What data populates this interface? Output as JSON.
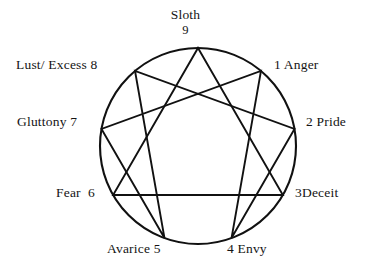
{
  "diagram": {
    "type": "enneagram",
    "geometry": {
      "center_x": 198,
      "center_y": 146,
      "radius": 98,
      "stroke_color": "#111111",
      "background_color": "#ffffff",
      "circle_stroke_width": 2.1,
      "chord_stroke_width": 1.9
    },
    "points": [
      {
        "number": "1",
        "label": "1 Anger",
        "passion": "Anger",
        "angle_deg": -50,
        "align": "left"
      },
      {
        "number": "2",
        "label": "2 Pride",
        "passion": "Pride",
        "angle_deg": -10,
        "align": "left"
      },
      {
        "number": "3",
        "label": "3Deceit",
        "passion": "Deceit",
        "angle_deg": 30,
        "align": "left"
      },
      {
        "number": "4",
        "label": "4 Envy",
        "passion": "Envy",
        "angle_deg": 70,
        "align": "left"
      },
      {
        "number": "5",
        "label": "Avarice 5",
        "passion": "Avarice",
        "angle_deg": 110,
        "align": "right"
      },
      {
        "number": "6",
        "label": "Fear  6",
        "passion": "Fear",
        "angle_deg": 150,
        "align": "right"
      },
      {
        "number": "7",
        "label": "Gluttony 7",
        "passion": "Gluttony",
        "angle_deg": 190,
        "align": "right"
      },
      {
        "number": "8",
        "label": "Lust/ Excess 8",
        "passion": "Lust/ Excess",
        "angle_deg": 230,
        "align": "right"
      },
      {
        "number": "9",
        "label": "Sloth",
        "passion": "Sloth",
        "number_below": "9",
        "angle_deg": 270,
        "align": "center"
      }
    ],
    "inner_triangle": [
      "9",
      "3",
      "6"
    ],
    "hexad_path": [
      "1",
      "4",
      "2",
      "8",
      "5",
      "7",
      "1"
    ]
  }
}
